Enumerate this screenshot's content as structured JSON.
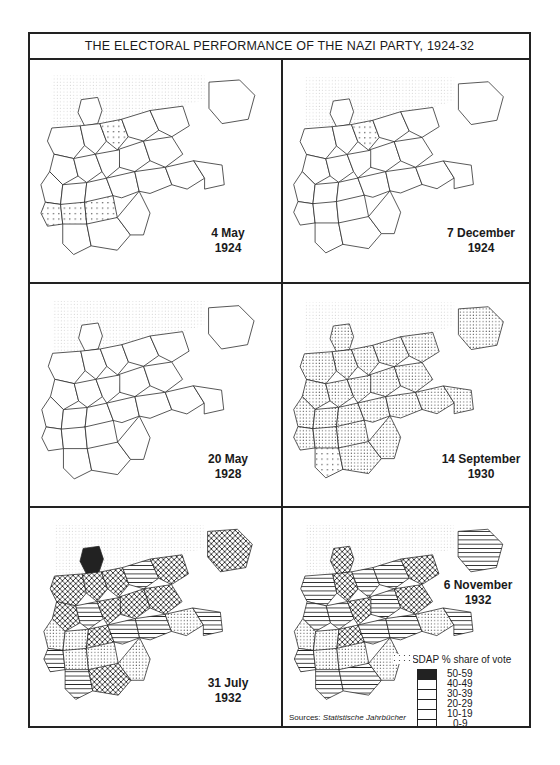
{
  "title": "THE ELECTORAL PERFORMANCE OF THE NAZI PARTY, 1924-32",
  "panels": [
    {
      "date": "4 May",
      "year": "1924",
      "regions": [
        "0",
        "0",
        "0",
        "1",
        "0",
        "0",
        "0",
        "0",
        "0",
        "0",
        "0",
        "0",
        "0",
        "0",
        "0",
        "0",
        "0",
        "0",
        "1",
        "1",
        "1",
        "0",
        "0",
        "0"
      ]
    },
    {
      "date": "7 December",
      "year": "1924",
      "regions": [
        "0",
        "0",
        "0",
        "1",
        "0",
        "0",
        "0",
        "0",
        "0",
        "0",
        "0",
        "0",
        "0",
        "0",
        "0",
        "0",
        "0",
        "0",
        "0",
        "0",
        "0",
        "0",
        "0",
        "0"
      ]
    },
    {
      "date": "20 May",
      "year": "1928",
      "regions": [
        "0",
        "0",
        "0",
        "0",
        "0",
        "0",
        "0",
        "0",
        "0",
        "0",
        "0",
        "0",
        "0",
        "0",
        "0",
        "0",
        "0",
        "0",
        "0",
        "0",
        "0",
        "0",
        "0",
        "0"
      ]
    },
    {
      "date": "14 September",
      "year": "1930",
      "regions": [
        "2",
        "2",
        "2",
        "2",
        "2",
        "2",
        "2",
        "2",
        "2",
        "2",
        "2",
        "2",
        "2",
        "2",
        "2",
        "2",
        "2",
        "2",
        "2",
        "2",
        "2",
        "1",
        "2",
        "2"
      ]
    },
    {
      "date": "31 July",
      "year": "1932",
      "regions": [
        "5",
        "4",
        "4",
        "4",
        "3",
        "4",
        "4",
        "4",
        "4",
        "3",
        "4",
        "2",
        "2",
        "4",
        "3",
        "3",
        "2",
        "3",
        "3",
        "2",
        "2",
        "3",
        "4",
        "2"
      ]
    },
    {
      "date": "6 November",
      "year": "1932",
      "regions": [
        "4",
        "3",
        "4",
        "3",
        "3",
        "4",
        "3",
        "4",
        "3",
        "3",
        "4",
        "2",
        "2",
        "4",
        "3",
        "3",
        "2",
        "3",
        "3",
        "2",
        "2",
        "3",
        "3",
        "2"
      ]
    }
  ],
  "legend": {
    "title": "NSDAP % share of vote",
    "items": [
      {
        "label": "50-59",
        "pattern": "solid"
      },
      {
        "label": "40-49",
        "pattern": "crosshatch"
      },
      {
        "label": "30-39",
        "pattern": "horizontal"
      },
      {
        "label": "20-29",
        "pattern": "dense-dots"
      },
      {
        "label": "10-19",
        "pattern": "sparse-dots"
      },
      {
        "label": "0-9",
        "pattern": "blank"
      }
    ]
  },
  "source": {
    "prefix": "Sources:",
    "name": "Statistische Jahrbücher"
  }
}
